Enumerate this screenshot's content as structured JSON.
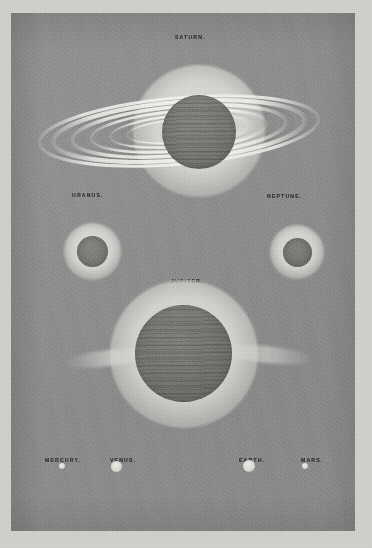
{
  "plate": {
    "type": "astronomical-comparative-sizes-plate",
    "background_color": "#8f8f8f",
    "paper_margin_color": "#d2d2cf",
    "ink_color": "#2e2e2e"
  },
  "labels": {
    "saturn": "SATURN.",
    "uranus": "URANUS.",
    "neptune": "NEPTUNE.",
    "jupiter": "JUPITER.",
    "mercury": "MERCURY.",
    "venus": "VENUS.",
    "earth": "EARTH.",
    "mars": "MARS."
  },
  "bodies": [
    {
      "name": "saturn",
      "label": "SATURN.",
      "has_rings": true,
      "has_bands": true,
      "disc_diameter_px": 74,
      "halo_diameter_px": 132,
      "center_x": 188,
      "center_y": 118
    },
    {
      "name": "uranus",
      "label": "URANUS.",
      "has_rings": false,
      "has_bands": false,
      "disc_diameter_px": 31,
      "halo_diameter_px": 57,
      "center_x": 82,
      "center_y": 239
    },
    {
      "name": "neptune",
      "label": "NEPTUNE.",
      "has_rings": false,
      "has_bands": false,
      "disc_diameter_px": 29,
      "halo_diameter_px": 54,
      "center_x": 287,
      "center_y": 240
    },
    {
      "name": "jupiter",
      "label": "JUPITER.",
      "has_rings": false,
      "has_bands": true,
      "disc_diameter_px": 97,
      "halo_diameter_px": 148,
      "center_x": 184,
      "center_y": 354
    },
    {
      "name": "mercury",
      "label": "MERCURY.",
      "has_rings": false,
      "has_bands": false,
      "disc_diameter_px": 6,
      "center_x": 62,
      "center_y": 466
    },
    {
      "name": "venus",
      "label": "VENUS.",
      "has_rings": false,
      "has_bands": false,
      "disc_diameter_px": 11,
      "center_x": 116,
      "center_y": 467
    },
    {
      "name": "earth",
      "label": "EARTH.",
      "has_rings": false,
      "has_bands": false,
      "disc_diameter_px": 12,
      "center_x": 249,
      "center_y": 466
    },
    {
      "name": "mars",
      "label": "MARS.",
      "has_rings": false,
      "has_bands": false,
      "disc_diameter_px": 6,
      "center_x": 305,
      "center_y": 466
    }
  ]
}
